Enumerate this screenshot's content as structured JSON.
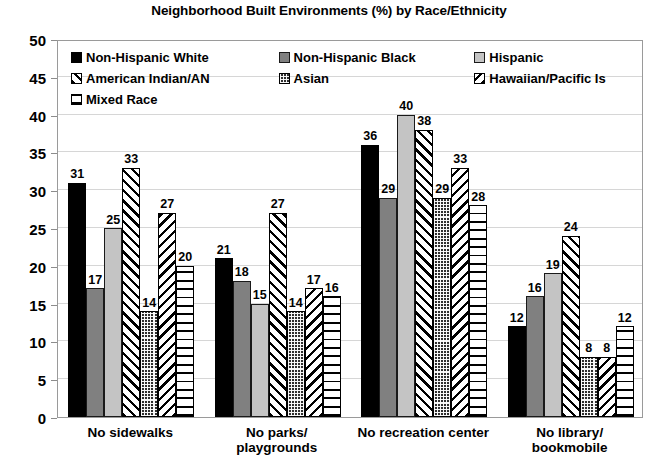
{
  "chart_data": {
    "type": "bar",
    "title": "Neighborhood Built Environments (%) by Race/Ethnicity",
    "xlabel": "",
    "ylabel": "",
    "ylim": [
      0,
      50
    ],
    "ytick_step": 5,
    "yticks": [
      "50",
      "45",
      "40",
      "35",
      "30",
      "25",
      "20",
      "15",
      "10",
      "5",
      "0"
    ],
    "grid": true,
    "legend_position": "inside-top-left",
    "data_labels": true,
    "categories": [
      "No sidewalks",
      "No parks/\nplaygrounds",
      "No recreation center",
      "No library/\nbookmobile"
    ],
    "series": [
      {
        "name": "Non-Hispanic White",
        "pattern": "solid-black",
        "values": [
          31,
          21,
          36,
          12
        ]
      },
      {
        "name": "Non-Hispanic Black",
        "pattern": "solid-dark-gray",
        "values": [
          17,
          18,
          29,
          16
        ]
      },
      {
        "name": "Hispanic",
        "pattern": "solid-light-gray",
        "values": [
          25,
          15,
          40,
          19
        ]
      },
      {
        "name": "American Indian/AN",
        "pattern": "diagonal-up",
        "values": [
          33,
          27,
          38,
          24
        ]
      },
      {
        "name": "Asian",
        "pattern": "dotted-grid",
        "values": [
          14,
          14,
          29,
          8
        ]
      },
      {
        "name": "Hawaiian/Pacific Is",
        "pattern": "diagonal-down",
        "values": [
          27,
          17,
          33,
          8
        ]
      },
      {
        "name": "Mixed Race",
        "pattern": "horizontal-lines",
        "values": [
          20,
          16,
          28,
          12
        ]
      }
    ]
  },
  "colors": {
    "series_black": "#000000",
    "series_dark_gray": "#808080",
    "series_light_gray": "#c4c4c4",
    "gridline": "#d6d6d6",
    "axis": "#9a9a9a",
    "text": "#000000",
    "background": "#ffffff"
  }
}
